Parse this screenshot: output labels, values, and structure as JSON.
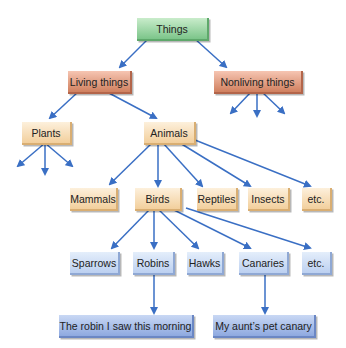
{
  "diagram": {
    "root": "Things",
    "level1": {
      "living": "Living things",
      "nonliving": "Nonliving things"
    },
    "level2": {
      "plants": "Plants",
      "animals": "Animals"
    },
    "animals": [
      "Mammals",
      "Birds",
      "Reptiles",
      "Insects",
      "etc."
    ],
    "birds": [
      "Sparrows",
      "Robins",
      "Hawks",
      "Canaries",
      "etc."
    ],
    "instances": {
      "robin": "The robin I saw this morning",
      "canary": "My aunt’s pet canary"
    },
    "colors": {
      "arrow": "#3a6fc4",
      "root": "#7cc58a",
      "level1": "#d0805f",
      "category": "#f2cf9c",
      "species": "#bcd0f0",
      "instance": "#8ea9e0"
    }
  }
}
